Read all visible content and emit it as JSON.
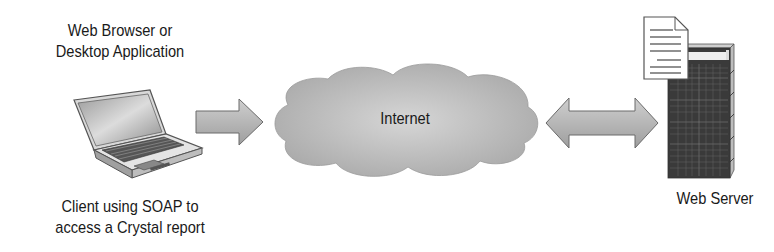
{
  "diagram": {
    "client": {
      "top_label_line1": "Web Browser or",
      "top_label_line2": "Desktop Application",
      "bottom_label_line1": "Client using SOAP to",
      "bottom_label_line2": "access a Crystal report",
      "icon": "laptop-icon"
    },
    "cloud": {
      "label": "Internet",
      "icon": "cloud-icon"
    },
    "server": {
      "label": "Web Server",
      "icon": "server-tower-icon",
      "document_icon": "document-icon"
    },
    "arrows": [
      {
        "from": "client",
        "to": "internet",
        "direction": "right",
        "icon": "arrow-right-icon"
      },
      {
        "from": "internet",
        "to": "server",
        "direction": "bidirectional",
        "icon": "arrow-double-icon"
      }
    ],
    "colors": {
      "fill_gray": "#b8b8b8",
      "dark_gray": "#555555",
      "outline": "#6a6a6a",
      "background": "#ffffff"
    }
  }
}
